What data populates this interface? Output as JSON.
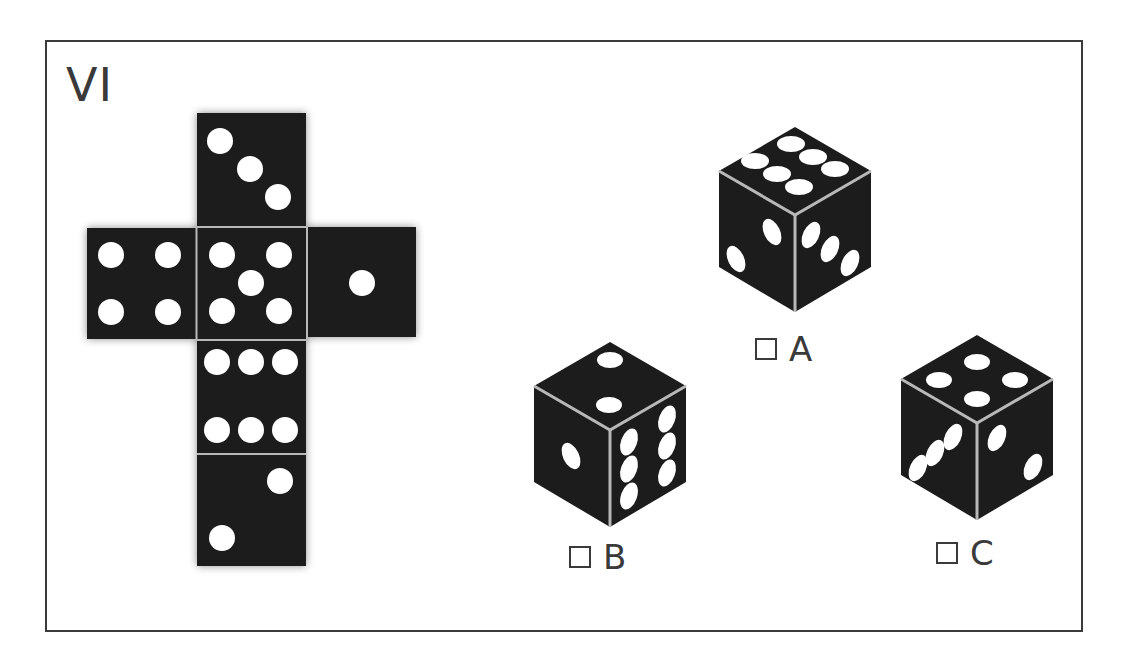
{
  "puzzle": {
    "title": "VI",
    "net": {
      "layout": "cross",
      "faces": [
        {
          "position": "top",
          "pips": 3
        },
        {
          "position": "left",
          "pips": 4
        },
        {
          "position": "center",
          "pips": 5
        },
        {
          "position": "right",
          "pips": 1
        },
        {
          "position": "below-1",
          "pips": 6
        },
        {
          "position": "below-2",
          "pips": 2
        }
      ]
    },
    "options": [
      {
        "label": "A",
        "top": 6,
        "left": 2,
        "right": 3
      },
      {
        "label": "B",
        "top": 2,
        "left": 1,
        "right": 6
      },
      {
        "label": "C",
        "top": 4,
        "left": 3,
        "right": 2
      }
    ]
  },
  "colors": {
    "face": "#1c1c1c",
    "pip": "#ffffff",
    "edge": "#b8b8b8",
    "frame": "#3a3a3a"
  }
}
